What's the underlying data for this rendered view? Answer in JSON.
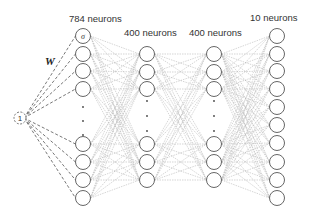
{
  "diagram": {
    "weight_label": "W",
    "bias_label": "1",
    "activation_symbol": "σ",
    "layers": [
      {
        "label": "784 neurons",
        "neurons": 784,
        "shown_top": 4,
        "shown_bottom": 4
      },
      {
        "label": "400 neurons",
        "neurons": 400,
        "shown_top": 3,
        "shown_bottom": 3
      },
      {
        "label": "400 neurons",
        "neurons": 400,
        "shown_top": 3,
        "shown_bottom": 3
      },
      {
        "label": "10 neurons",
        "neurons": 10,
        "shown_top": 10,
        "shown_bottom": 0
      }
    ],
    "colors": {
      "node_stroke": "#555555",
      "edge": "#bbbbbb",
      "bias_edge": "#555555",
      "text": "#333333"
    }
  }
}
